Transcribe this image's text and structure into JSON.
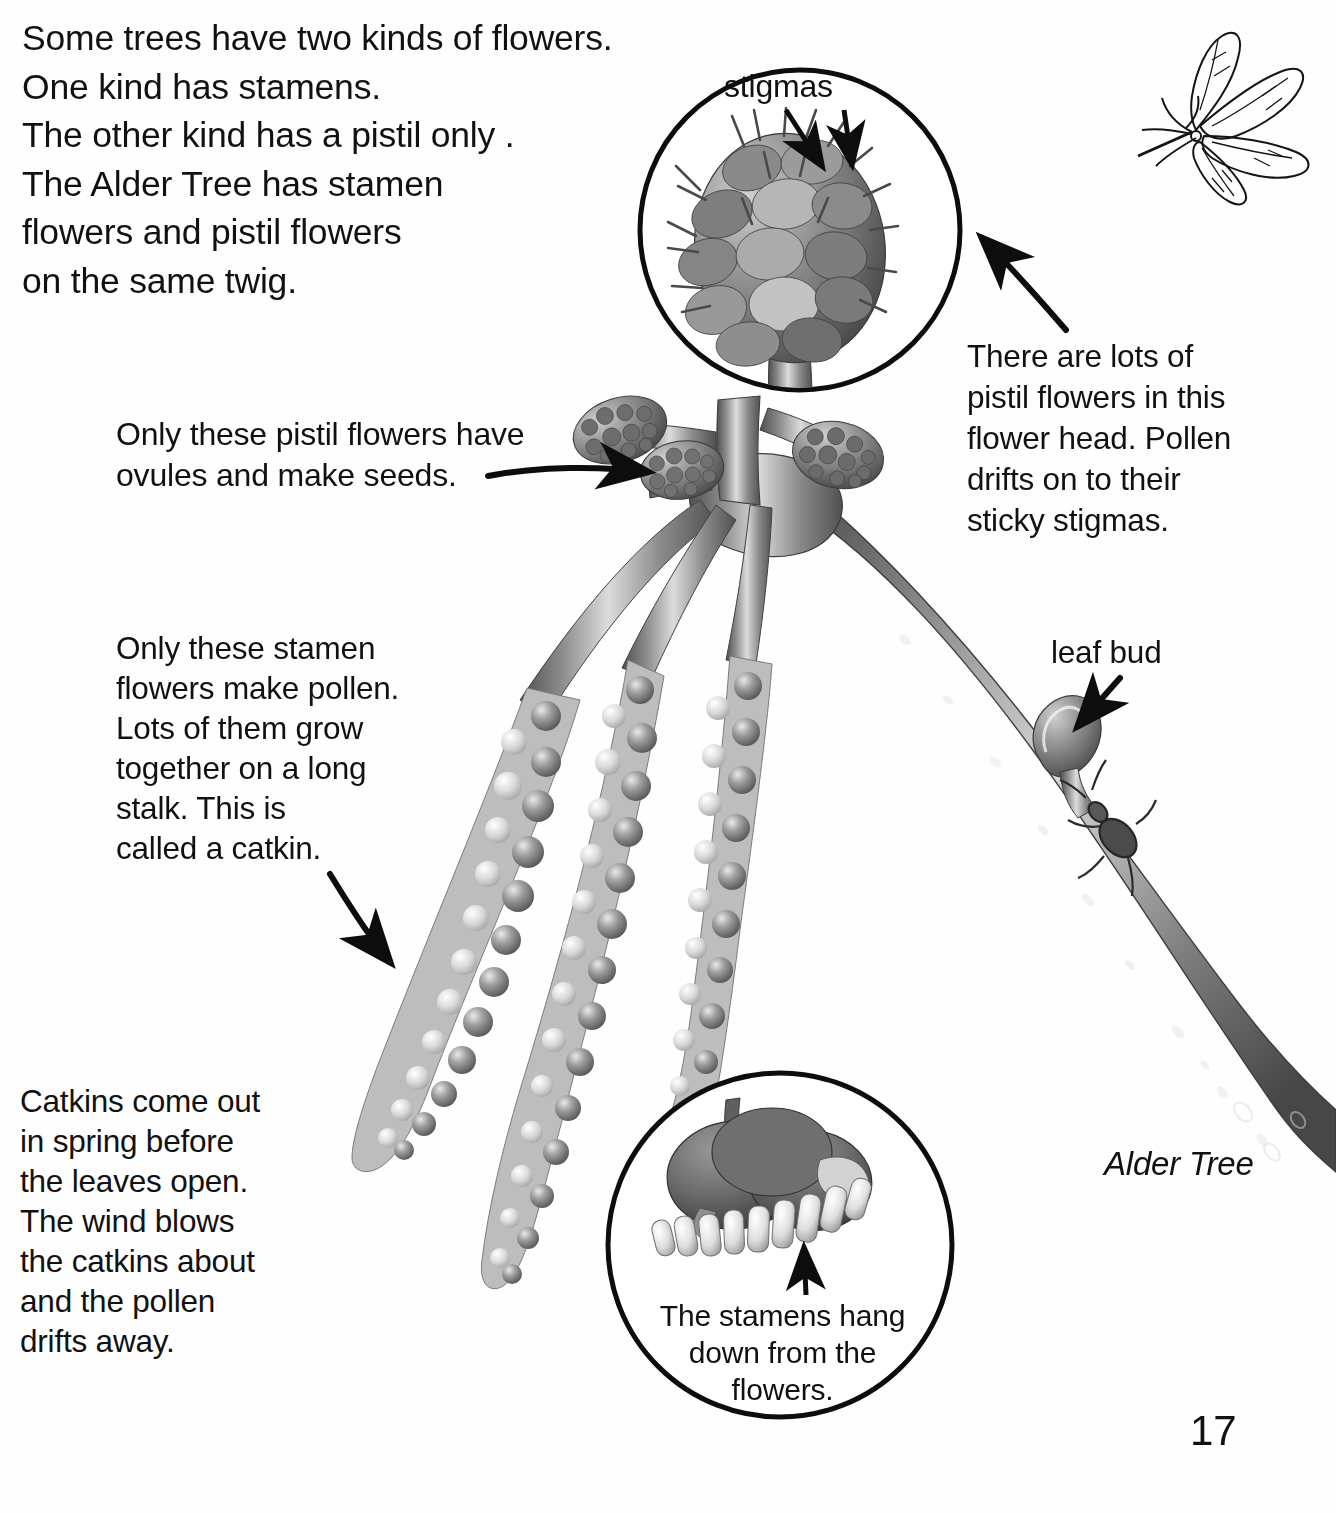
{
  "page": {
    "number": "17",
    "background_color": "#ffffff",
    "ink_color": "#111111"
  },
  "intro": {
    "text": "Some trees have two kinds of flowers.\nOne kind has stamens.\nThe other kind has a pistil only .\nThe Alder Tree has stamen\nflowers and pistil flowers\non the same twig."
  },
  "annotations": {
    "pistil_note": "Only these pistil flowers have\novules and make seeds.",
    "flower_head_note": "There are lots of\npistil flowers in this\nflower head. Pollen\ndrifts on to their\nsticky stigmas.",
    "stamen_note": "Only these stamen\nflowers make pollen.\nLots of them grow\ntogether on a long\nstalk. This is\ncalled a catkin.",
    "catkin_note": "Catkins come out\nin spring before\nthe leaves open.\nThe wind blows\nthe catkins about\nand the pollen\ndrifts away.",
    "leaf_bud_label": "leaf bud",
    "species_label": "Alder Tree"
  },
  "inset_top": {
    "label": "stigmas",
    "subject": "female-flower-head",
    "center": {
      "x": 800,
      "y": 230
    },
    "radius": 160,
    "arrow_count": 2
  },
  "inset_bottom": {
    "caption": "The stamens hang\ndown from the\nflowers.",
    "subject": "stamen-flower-closeup",
    "center": {
      "x": 780,
      "y": 1245
    },
    "radius": 172,
    "arrow_count": 1
  },
  "illustration": {
    "title": "Alder twig with catkins and female flower heads",
    "catkin_count": 3,
    "female_flower_head_count": 4,
    "has_leaf_bud": true,
    "has_weevil": true,
    "corner_sketch": "alder-leaf-twig-line-drawing"
  },
  "palette": {
    "ink": "#111111",
    "paper": "#ffffff",
    "catkin_dark": "#6f6f6f",
    "catkin_mid": "#9a9a9a",
    "catkin_light": "#d6d6d6",
    "twig_dark": "#5c5c5c",
    "twig_mid": "#8d8d8d",
    "twig_light": "#cfcfcf"
  }
}
